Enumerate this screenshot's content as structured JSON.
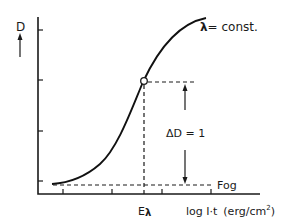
{
  "diagram": {
    "type": "characteristic-curve",
    "y_axis": {
      "label": "D",
      "direction_arrow": "up"
    },
    "x_axis": {
      "label": "log I·t (erg/cm²)",
      "unit_label": "log I·t",
      "unit": "(erg/cm",
      "unit_sup": "2",
      "unit_close": ")"
    },
    "curve_label": {
      "symbol": "λ",
      "text": "= const."
    },
    "marker_label": "Eλ",
    "marker_symbol_E": "E",
    "marker_symbol_lambda": "λ",
    "delta_label": "ΔD = 1",
    "fog_label": "Fog",
    "y_ticks": 4,
    "x_ticks": 4
  }
}
